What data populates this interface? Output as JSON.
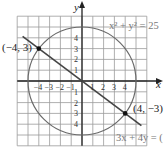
{
  "chart_data": {
    "type": "line",
    "title": "",
    "xlabel": "x",
    "ylabel": "y",
    "xlim": [
      -6,
      6
    ],
    "ylim": [
      -6,
      6
    ],
    "grid": true,
    "x_ticks": [
      -4,
      -3,
      -2,
      -1,
      1,
      2,
      3,
      4
    ],
    "y_ticks": [
      4,
      3,
      2,
      1,
      -1,
      -2,
      -3,
      -4
    ],
    "x_tick_labels": [
      "−4",
      "−3",
      "−2",
      "−1",
      "1",
      "2",
      "3",
      "4"
    ],
    "y_tick_labels": [
      "4",
      "3",
      "2",
      "1",
      "1",
      "2",
      "3",
      "4"
    ],
    "series": [
      {
        "name": "x² + y² = 25",
        "kind": "circle",
        "center": [
          0,
          0
        ],
        "radius": 5
      },
      {
        "name": "3x + 4y = 0",
        "kind": "line",
        "points": [
          [
            -5.5,
            4.125
          ],
          [
            5.5,
            -4.125
          ]
        ]
      }
    ],
    "points": [
      {
        "label": "(−4, 3)",
        "x": -4,
        "y": 3
      },
      {
        "label": "(4, −3)",
        "x": 4,
        "y": -3
      }
    ],
    "annotations": [
      {
        "text": "x² + y² = 25",
        "position": "top-right"
      },
      {
        "text": "3x + 4y = 0",
        "position": "bottom-right"
      }
    ]
  },
  "labels": {
    "x_axis": "x",
    "y_axis": "y",
    "circle_eq_base": "x",
    "circle_eq": "x² + y² = 25",
    "line_eq": "3x + 4y = (",
    "point_a": "(−4, 3)",
    "point_b": "(4, −3)"
  }
}
